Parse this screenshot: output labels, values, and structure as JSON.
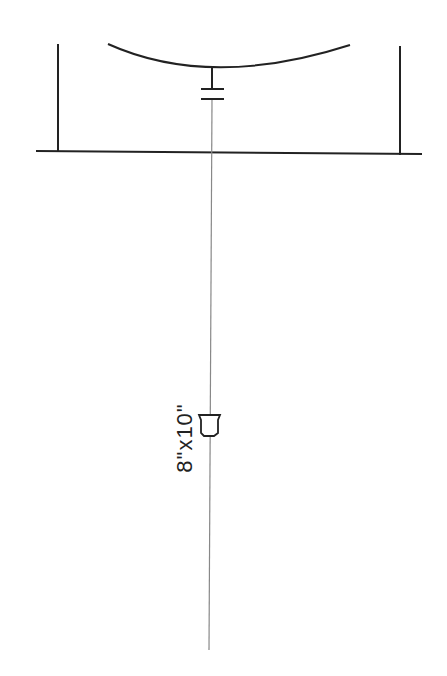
{
  "diagram": {
    "type": "schematic",
    "elements": [
      {
        "kind": "wall-left",
        "icon": "vertical-line"
      },
      {
        "kind": "wall-right",
        "icon": "vertical-line"
      },
      {
        "kind": "ground-line",
        "icon": "horizontal-line"
      },
      {
        "kind": "reflector-arc",
        "icon": "curved-arc"
      },
      {
        "kind": "capacitor",
        "icon": "capacitor-symbol"
      },
      {
        "kind": "feed-line",
        "icon": "vertical-line"
      },
      {
        "kind": "horn",
        "icon": "trapezoid-cup"
      }
    ],
    "size_label": "8\"x10\""
  }
}
